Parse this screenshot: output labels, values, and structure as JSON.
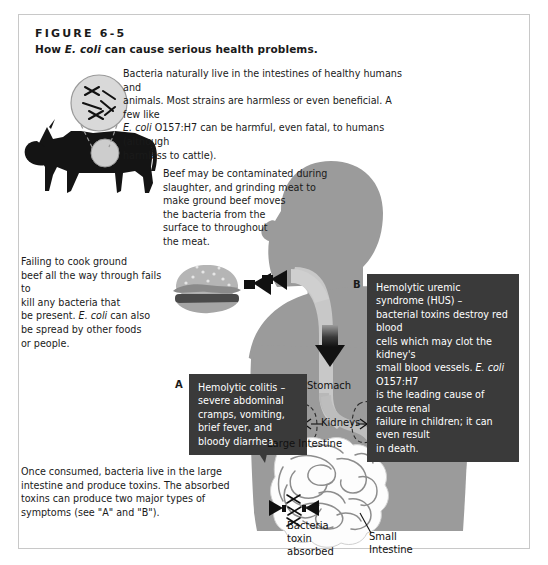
{
  "figure": {
    "number_label": "FIGURE 6-5",
    "caption_prefix": "How ",
    "caption_italic": "E. coli",
    "caption_suffix": " can cause serious health problems."
  },
  "colors": {
    "frame_border": "#c8c8c8",
    "body_silhouette": "#9b9b9b",
    "body_light": "#c4c4c4",
    "callout_bg": "#3a3a3a",
    "callout_text": "#ffffff",
    "text": "#1a1a1a",
    "cow": "#141414",
    "arrow": "#111111",
    "intestine_fill": "#fdfdfd",
    "intestine_stroke": "#8b8b8b"
  },
  "paragraphs": {
    "cattle": "Bacteria naturally live in the intestines of healthy humans and animals. Most strains are harmless or even beneficial. A few like E. coli O157:H7 can be harmful, even fatal, to humans (although harmless to cattle).",
    "cattle_lines": [
      "Bacteria naturally live in the intestines of healthy humans and",
      "animals. Most strains are harmless or even beneficial. A few like",
      "E. coli O157:H7 can be harmful, even fatal, to humans (although",
      "harmless to cattle)."
    ],
    "beef": "Beef may be contaminated during slaughter, and grinding meat to make ground beef moves the bacteria from the surface to throughout the meat.",
    "beef_lines": [
      "Beef may be contaminated during",
      "slaughter, and grinding meat to",
      "make ground beef moves",
      "the bacteria from the",
      "surface to throughout",
      "the meat."
    ],
    "cooking": "Failing to cook ground beef all the way through fails to kill any bacteria that may be present. E. coli can also be spread by other foods or people.",
    "cooking_lines": [
      "Failing to cook ground",
      "beef all the way through fails to",
      "kill any bacteria that",
      "may be present. E. coli can also",
      "be spread by other foods",
      "or people."
    ],
    "consumed": "Once consumed, bacteria live in the large intestine and produce toxins. The absorbed toxins can produce two major types of symptoms (see \"A\" and \"B\").",
    "consumed_lines": [
      "Once consumed, bacteria live in the large",
      "intestine and produce toxins. The absorbed",
      "toxins can produce two major types of",
      "symptoms (see \"A\" and \"B\")."
    ]
  },
  "callouts": {
    "a": {
      "letter": "A",
      "text": "Hemolytic colitis – severe abdominal cramps, vomiting, brief fever, and bloody diarrhea.",
      "lines": [
        "Hemolytic colitis –",
        "severe abdominal",
        "cramps, vomiting,",
        "brief fever, and",
        "bloody diarrhea."
      ]
    },
    "b": {
      "letter": "B",
      "text": "Hemolytic uremic syndrome (HUS) – bacterial toxins destroy red blood cells which may clot the kidney's small blood vessels. E. coli O157:H7 is the leading cause of acute renal failure in children; it can even result in death.",
      "lines": [
        "Hemolytic uremic syndrome (HUS) –",
        "bacterial toxins destroy red blood",
        "cells which may clot the kidney's",
        "small blood vessels. E. coli O157:H7",
        "is the leading cause of acute renal",
        "failure in children; it can even result",
        "in death."
      ]
    }
  },
  "organ_labels": {
    "stomach": "Stomach",
    "kidneys": "Kidneys",
    "large_intestine": "Large Intestine",
    "small_intestine_line1": "Small",
    "small_intestine_line2": "Intestine",
    "bacteria_line1": "Bacteria",
    "bacteria_line2": "toxin",
    "bacteria_line3": "absorbed"
  },
  "graphics": {
    "cow": "cow-silhouette",
    "bacteria_magnifier": "bacteria-magnifier-circle",
    "hamburger": "hamburger-icon",
    "human_body": "human-body-silhouette",
    "arrow_beef_to_mouth": "arrow-right",
    "arrow_burger_to_body": "arrow-right",
    "arrow_esophagus_down": "arrow-down",
    "arrow_toxin_left": "arrow-left",
    "arrow_toxin_right": "arrow-right"
  }
}
